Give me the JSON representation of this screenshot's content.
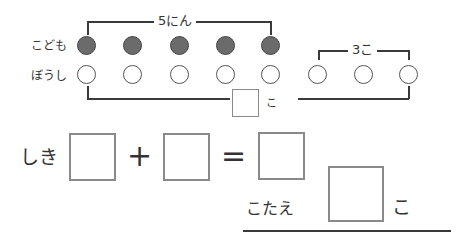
{
  "diagram": {
    "top_bracket_label": "5にん",
    "right_bracket_label": "3こ",
    "rows": [
      {
        "label": "こども",
        "filled_count": 5,
        "total": 5
      },
      {
        "label": "ぼうし",
        "filled_count": 0,
        "total": 8
      }
    ],
    "answer_box_unit": "こ"
  },
  "equation": {
    "label": "しき",
    "plus": "+",
    "equals": "="
  },
  "answer": {
    "label": "こたえ",
    "unit": "こ"
  },
  "colors": {
    "filled_circle": "#6b6b6b",
    "box_border": "#8a8a8a",
    "line": "#3a3a3a"
  }
}
